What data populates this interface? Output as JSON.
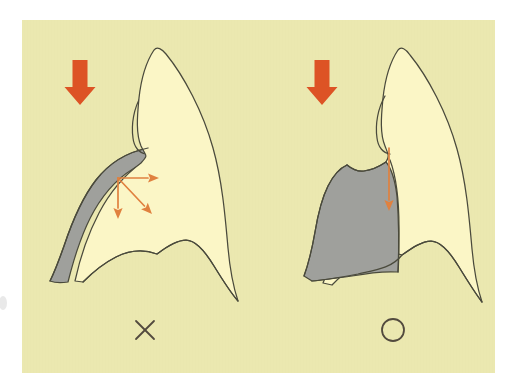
{
  "figure": {
    "title": "Occlusal force direction on tooth with cervical lesion",
    "canvas": {
      "width": 507,
      "height": 390
    },
    "panel": {
      "x": 22,
      "y": 20,
      "width": 473,
      "height": 353,
      "background_color": "#ebe8b0"
    },
    "colors": {
      "panel_background": "#ebe8b0",
      "tooth_fill": "#fbf6c6",
      "lesion_fill": "#9fa09c",
      "outline": "#4a4a3c",
      "thick_arrow": "#dd5325",
      "thin_arrow": "#e0813f",
      "mark": "#524a3e",
      "page_white": "#ffffff"
    },
    "panels": [
      {
        "id": "left",
        "name": "incorrect-case",
        "verdict_symbol": "×",
        "verdict_name": "cross-mark",
        "verdict_meaning": "incorrect",
        "verdict_position": {
          "x": 145,
          "y": 330
        },
        "load_arrow": {
          "name": "occlusal-load-arrow",
          "style": "thick",
          "direction": "down",
          "color": "#dd5325",
          "x": 80,
          "y_top": 60,
          "y_bottom": 105
        },
        "force_vectors": [
          {
            "name": "lateral-force-arrow",
            "direction": "right",
            "from": [
              118,
              178
            ],
            "to": [
              159,
              178
            ]
          },
          {
            "name": "oblique-force-arrow",
            "direction": "down-right",
            "from": [
              118,
              178
            ],
            "to": [
              152,
              214
            ]
          },
          {
            "name": "axial-force-arrow",
            "direction": "down",
            "from": [
              118,
              178
            ],
            "to": [
              118,
              219
            ]
          }
        ],
        "lesion": {
          "name": "cervical-lesion-wedge",
          "shape": "narrow crescent along mesial cervical wall",
          "fill": "#9fa09c"
        }
      },
      {
        "id": "right",
        "name": "correct-case",
        "verdict_symbol": "○",
        "verdict_name": "circle-mark",
        "verdict_meaning": "correct",
        "verdict_position": {
          "x": 393,
          "y": 330
        },
        "load_arrow": {
          "name": "occlusal-load-arrow",
          "style": "thick",
          "direction": "down",
          "color": "#dd5325",
          "x": 322,
          "y_top": 60,
          "y_bottom": 105
        },
        "force_vectors": [
          {
            "name": "axial-force-arrow",
            "direction": "down",
            "from": [
              389,
              148
            ],
            "to": [
              389,
              211
            ]
          }
        ],
        "lesion": {
          "name": "cervical-restoration-block",
          "shape": "broad rounded block filling cervical third",
          "fill": "#9fa09c"
        }
      }
    ]
  }
}
